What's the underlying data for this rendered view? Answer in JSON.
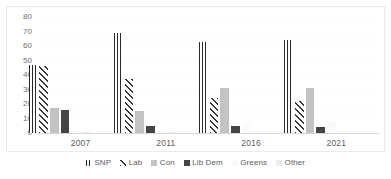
{
  "chart_data": {
    "type": "bar",
    "title": "",
    "subtitle": "",
    "xlabel": "",
    "ylabel": "",
    "categories": [
      "2007",
      "2011",
      "2016",
      "2021"
    ],
    "ylim": [
      0,
      80
    ],
    "yticks": [
      "0",
      "10",
      "20",
      "30",
      "40",
      "50",
      "60",
      "70",
      "80"
    ],
    "grid": true,
    "legend_position": "bottom",
    "series": [
      {
        "name": "SNP",
        "values": [
          47,
          69,
          63,
          64
        ],
        "color": "#2b2b2b",
        "fill": "vertical-stripes"
      },
      {
        "name": "Lab",
        "values": [
          46,
          37,
          24,
          22
        ],
        "color": "#3a3a3a",
        "fill": "diagonal-hatch"
      },
      {
        "name": "Con",
        "values": [
          17,
          15,
          31,
          31
        ],
        "color": "#c3c3c3",
        "fill": "solid-light-gray"
      },
      {
        "name": "Lib Dem",
        "values": [
          16,
          5,
          5,
          4
        ],
        "color": "#454545",
        "fill": "solid-dark-gray"
      },
      {
        "name": "Greens",
        "values": [
          2,
          2,
          6,
          8
        ],
        "color": "#fafafa",
        "fill": "solid-near-white"
      },
      {
        "name": "Other",
        "values": [
          1,
          1,
          0,
          0
        ],
        "color": "#ededed",
        "fill": "solid-very-light-gray"
      }
    ]
  },
  "axes": {
    "y_tick_color": "#6f6f6f",
    "x_tick_color": "#5f5f5f",
    "axis_line_color": "#d9d9d9",
    "frame_color": "#eceaea"
  },
  "legend": {
    "items": [
      {
        "label": "SNP"
      },
      {
        "label": "Lab"
      },
      {
        "label": "Con"
      },
      {
        "label": "Lib Dem"
      },
      {
        "label": "Greens"
      },
      {
        "label": "Other"
      }
    ]
  }
}
